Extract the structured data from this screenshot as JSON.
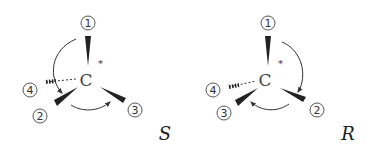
{
  "diagrams": [
    {
      "center_atom": "C",
      "stereo_mark": "*",
      "substituents": [
        "1",
        "2",
        "3",
        "4"
      ],
      "rotation": "counterclockwise",
      "configuration": "S"
    },
    {
      "center_atom": "C",
      "stereo_mark": "*",
      "substituents": [
        "1",
        "2",
        "3",
        "4"
      ],
      "rotation": "clockwise",
      "configuration": "R"
    }
  ]
}
